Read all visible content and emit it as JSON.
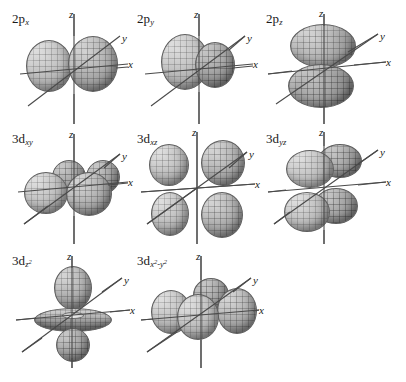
{
  "figure": {
    "background_color": "#ffffff",
    "lobe_color": "#a8a8a8",
    "axis_color": "#4a4a4a",
    "columns": 3,
    "rows": 3
  },
  "axis_labels": {
    "x": "x",
    "y": "y",
    "z": "z"
  },
  "orbitals": [
    {
      "id": "2px",
      "shell": "2",
      "type": "p",
      "subscript": "x",
      "subscript_html": "x",
      "label_main": "2p",
      "node_plane": "yz",
      "lobe_count": 2,
      "orientation": "along-x",
      "row": 0,
      "col": 0
    },
    {
      "id": "2py",
      "shell": "2",
      "type": "p",
      "subscript": "y",
      "subscript_html": "y",
      "label_main": "2p",
      "node_plane": "xz",
      "lobe_count": 2,
      "orientation": "along-y",
      "row": 0,
      "col": 1
    },
    {
      "id": "2pz",
      "shell": "2",
      "type": "p",
      "subscript": "z",
      "subscript_html": "z",
      "label_main": "2p",
      "node_plane": "xy",
      "lobe_count": 2,
      "orientation": "along-z",
      "row": 0,
      "col": 2
    },
    {
      "id": "3dxy",
      "shell": "3",
      "type": "d",
      "subscript": "xy",
      "subscript_html": "xy",
      "label_main": "3d",
      "node_plane": "xz and yz",
      "lobe_count": 4,
      "orientation": "in-xy-plane-between-axes",
      "row": 1,
      "col": 0
    },
    {
      "id": "3dxz",
      "shell": "3",
      "type": "d",
      "subscript": "xz",
      "subscript_html": "xz",
      "label_main": "3d",
      "node_plane": "xy and yz",
      "lobe_count": 4,
      "orientation": "in-xz-plane-between-axes",
      "row": 1,
      "col": 1
    },
    {
      "id": "3dyz",
      "shell": "3",
      "type": "d",
      "subscript": "yz",
      "subscript_html": "yz",
      "label_main": "3d",
      "node_plane": "xy and xz",
      "lobe_count": 4,
      "orientation": "in-yz-plane-between-axes",
      "row": 1,
      "col": 2
    },
    {
      "id": "3dz2",
      "shell": "3",
      "type": "d",
      "subscript": "z2",
      "subscript_html": "z<sup>2</sup>",
      "label_main": "3d",
      "node_plane": "conical",
      "lobe_count": 2,
      "has_torus": true,
      "orientation": "along-z-with-equatorial-ring",
      "row": 2,
      "col": 0
    },
    {
      "id": "3dx2-y2",
      "shell": "3",
      "type": "d",
      "subscript": "x2-y2",
      "subscript_html": "x<sup>2</sup>-y<sup>2</sup>",
      "label_main": "3d",
      "node_plane": "diagonal vertical planes",
      "lobe_count": 4,
      "orientation": "in-xy-plane-along-axes",
      "row": 2,
      "col": 1
    }
  ],
  "chart_data": {
    "type": "diagram",
    "grid_layout": "3 columns x 3 rows (8 panels, last cell empty)",
    "panels": [
      "2px",
      "2py",
      "2pz",
      "3dxy",
      "3dxz",
      "3dyz",
      "3dz2",
      "3dx2-y2",
      ""
    ],
    "axes_per_panel": [
      "x",
      "y",
      "z"
    ],
    "legend": []
  }
}
